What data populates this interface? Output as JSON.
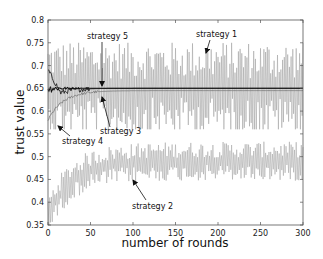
{
  "chart_data": {
    "type": "line",
    "title": "",
    "xlabel": "number of rounds",
    "ylabel": "trust value",
    "xlim": [
      0,
      300
    ],
    "ylim": [
      0.35,
      0.8
    ],
    "xticks": [
      0,
      50,
      100,
      150,
      200,
      250,
      300
    ],
    "xtick_labels": [
      "0",
      "50",
      "100",
      "150",
      "200",
      "250",
      "300"
    ],
    "yticks": [
      0.35,
      0.4,
      0.45,
      0.5,
      0.55,
      0.6,
      0.65,
      0.7,
      0.75,
      0.8
    ],
    "ytick_labels": [
      "0.35",
      "0.4",
      "0.45",
      "0.5",
      "0.55",
      "0.6",
      "0.65",
      "0.7",
      "0.75",
      "0.8"
    ],
    "grid": false,
    "legend": "none (inline annotations with arrows)",
    "series": [
      {
        "name": "strategy 1",
        "description": "oscillates strongly around 0.65, range ~0.57-0.75",
        "approx_mean": 0.65,
        "approx_min": 0.56,
        "approx_max": 0.75,
        "color": "#9a9a9a"
      },
      {
        "name": "strategy 2",
        "description": "rises from ~0.37 at round 0 to oscillate around ~0.49 after round 75",
        "start": 0.37,
        "plateau": 0.49,
        "approx_min": 0.43,
        "approx_max": 0.54,
        "color": "#a0a0a0"
      },
      {
        "name": "strategy 3",
        "description": "rises from ~0.58 to converge near 0.645 by ~round 60",
        "start": 0.58,
        "converged": 0.645,
        "color": "#777777"
      },
      {
        "name": "strategy 4",
        "description": "starts ~0.69, drops to ~0.64 then settles at 0.65",
        "start": 0.69,
        "converged": 0.65,
        "color": "#222222"
      },
      {
        "name": "strategy 5",
        "description": "flat line at 0.65 after initial noise",
        "converged": 0.65,
        "color": "#111111"
      }
    ],
    "annotations": [
      {
        "text": "strategy 5",
        "x": 22,
        "y": 0.76
      },
      {
        "text": "strategy 1",
        "x": 190,
        "y": 0.765
      },
      {
        "text": "strategy 3",
        "x": 66,
        "y": 0.56
      },
      {
        "text": "strategy 4",
        "x": 18,
        "y": 0.55
      },
      {
        "text": "strategy 2",
        "x": 105,
        "y": 0.43
      }
    ]
  },
  "labels": {
    "xlabel": "number of rounds",
    "ylabel": "trust value",
    "s1": "strategy 1",
    "s2": "strategy 2",
    "s3": "strategy 3",
    "s4": "strategy 4",
    "s5": "strategy 5"
  }
}
